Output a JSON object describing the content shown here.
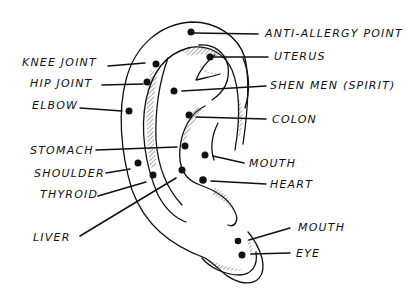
{
  "diagram": {
    "title": "",
    "colors": {
      "ink": "#111111",
      "background": "#ffffff"
    },
    "labels": [
      {
        "id": "anti-allergy",
        "text": "ANTI-ALLERGY POINT",
        "side": "right",
        "x": 265,
        "y": 28,
        "dot": [
          191,
          32
        ],
        "line_end": [
          258,
          34
        ]
      },
      {
        "id": "uterus",
        "text": "UTERUS",
        "side": "right",
        "x": 274,
        "y": 51,
        "dot": [
          210,
          57
        ],
        "line_end": [
          268,
          57
        ]
      },
      {
        "id": "shen-men",
        "text": "SHEN MEN (SPIRIT)",
        "side": "right",
        "x": 270,
        "y": 81,
        "dot": [
          174,
          91
        ],
        "line_end": [
          266,
          86
        ]
      },
      {
        "id": "colon",
        "text": "COLON",
        "side": "right",
        "x": 272,
        "y": 114,
        "dot": [
          189,
          115
        ],
        "line_end": [
          266,
          119
        ]
      },
      {
        "id": "mouth-upper",
        "text": "MOUTH",
        "side": "right",
        "x": 249,
        "y": 157,
        "dot": [
          205,
          155
        ],
        "line_end": [
          244,
          163
        ]
      },
      {
        "id": "heart",
        "text": "HEART",
        "side": "right",
        "x": 270,
        "y": 179,
        "dot": [
          203,
          180
        ],
        "line_end": [
          266,
          184
        ]
      },
      {
        "id": "mouth-lobe",
        "text": "MOUTH",
        "side": "right",
        "x": 298,
        "y": 222,
        "dot": [
          238,
          241
        ],
        "line_end": [
          290,
          228
        ]
      },
      {
        "id": "eye",
        "text": "EYE",
        "side": "right",
        "x": 296,
        "y": 248,
        "dot": [
          242,
          255
        ],
        "line_end": [
          290,
          253
        ]
      },
      {
        "id": "knee-joint",
        "text": "KNEE JOINT",
        "side": "left",
        "x": 22,
        "y": 57,
        "dot": [
          156,
          64
        ],
        "line_end": [
          108,
          66
        ]
      },
      {
        "id": "hip-joint",
        "text": "HIP JOINT",
        "side": "left",
        "x": 30,
        "y": 78,
        "dot": [
          147,
          82
        ],
        "line_end": [
          102,
          85
        ]
      },
      {
        "id": "elbow",
        "text": "ELBOW",
        "side": "left",
        "x": 32,
        "y": 100,
        "dot": [
          129,
          111
        ],
        "line_end": [
          80,
          108
        ]
      },
      {
        "id": "stomach",
        "text": "STOMACH",
        "side": "left",
        "x": 30,
        "y": 146,
        "dot": [
          185,
          146
        ],
        "line_end": [
          96,
          150
        ]
      },
      {
        "id": "shoulder",
        "text": "SHOULDER",
        "side": "left",
        "x": 34,
        "y": 168,
        "dot": [
          138,
          163
        ],
        "line_end": [
          106,
          173
        ]
      },
      {
        "id": "thyroid",
        "text": "THYROID",
        "side": "left",
        "x": 40,
        "y": 189,
        "dot": [
          153,
          175
        ],
        "line_end": [
          98,
          196
        ]
      },
      {
        "id": "liver",
        "text": "LIVER",
        "side": "left",
        "x": 33,
        "y": 232,
        "dot": [
          182,
          170
        ],
        "line_end": [
          80,
          236
        ]
      }
    ]
  }
}
